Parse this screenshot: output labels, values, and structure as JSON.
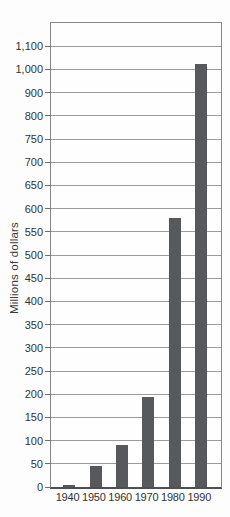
{
  "figure": {
    "y_axis_title": "Millions of dollars"
  },
  "chart_data": {
    "type": "bar",
    "title": "",
    "xlabel": "",
    "ylabel": "Millions of dollars",
    "categories": [
      "1940",
      "1950",
      "1960",
      "1970",
      "1980",
      "1990"
    ],
    "values": [
      5,
      45,
      90,
      195,
      580,
      1025
    ],
    "y_tick_labels": [
      "1,100",
      "1,000",
      "900",
      "800",
      "750",
      "700",
      "650",
      "600",
      "550",
      "500",
      "450",
      "400",
      "350",
      "300",
      "250",
      "200",
      "150",
      "100",
      "50",
      "0"
    ],
    "y_axis_scale_note": "non-uniform axis: gridlines equally spaced; value steps are 100 above 800 and 50 from 0 to 800",
    "ylim": [
      0,
      1200
    ],
    "grid": true,
    "legend_position": "none",
    "bar_color": "#57595c",
    "gridline_color": "#9b9b9b",
    "axis_text_color": "#333333"
  }
}
